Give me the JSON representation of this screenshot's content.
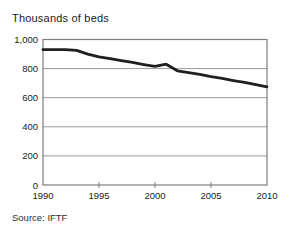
{
  "chart_data": {
    "type": "line",
    "title": "Thousands of beds",
    "source": "Source: IFTF",
    "x": [
      1990,
      1991,
      1992,
      1993,
      1994,
      1995,
      1996,
      1997,
      1998,
      1999,
      2000,
      2001,
      2002,
      2003,
      2004,
      2005,
      2006,
      2007,
      2008,
      2009,
      2010
    ],
    "series": [
      {
        "name": "Thousands of beds",
        "values": [
          930,
          930,
          930,
          925,
          900,
          880,
          868,
          855,
          842,
          828,
          815,
          830,
          785,
          772,
          760,
          745,
          732,
          718,
          705,
          690,
          675
        ]
      }
    ],
    "xlabel": "",
    "ylabel": "Thousands of beds",
    "xlim": [
      1990,
      2010
    ],
    "ylim": [
      0,
      1000
    ],
    "x_ticks": [
      1990,
      1995,
      2000,
      2005,
      2010
    ],
    "y_ticks": [
      0,
      200,
      400,
      600,
      800,
      1000
    ],
    "y_tick_labels": [
      "0",
      "200",
      "400",
      "600",
      "800",
      "1,000"
    ],
    "grid": true,
    "legend": false,
    "colors": {
      "line": "#1f1f1f",
      "grid": "#9a9a9a",
      "frame": "#7d7d7d",
      "text": "#1a1a1a"
    }
  }
}
